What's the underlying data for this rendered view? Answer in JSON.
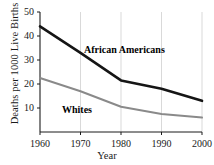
{
  "chart_data": {
    "type": "line",
    "title": "",
    "xlabel": "Year",
    "ylabel": "Deaths per 1000 Live Births",
    "x": [
      1960,
      1970,
      1980,
      1990,
      2000
    ],
    "xtick_labels": [
      "1960",
      "1970",
      "1980",
      "1990",
      "2000"
    ],
    "ytick_labels": [
      "10",
      "20",
      "30",
      "40",
      "50"
    ],
    "yticks": [
      10,
      20,
      30,
      40,
      50
    ],
    "xlim": [
      1960,
      2000
    ],
    "ylim": [
      0,
      50
    ],
    "grid": "vertical-only",
    "legend": "inline-annotations",
    "series": [
      {
        "name": "African Americans",
        "color": "#151515",
        "width": 2.6,
        "values": [
          44,
          33,
          21.5,
          18,
          13
        ]
      },
      {
        "name": "Whites",
        "color": "#8a8a8a",
        "width": 2.0,
        "values": [
          22.5,
          17,
          10.5,
          7.5,
          6
        ]
      }
    ],
    "annotations": [
      {
        "text": "African Americans",
        "series": "African Americans"
      },
      {
        "text": "Whites",
        "series": "Whites"
      }
    ]
  },
  "colors": {
    "axis": "#1a1a1a",
    "grid": "#d9d9d9",
    "background": "#ffffff"
  }
}
